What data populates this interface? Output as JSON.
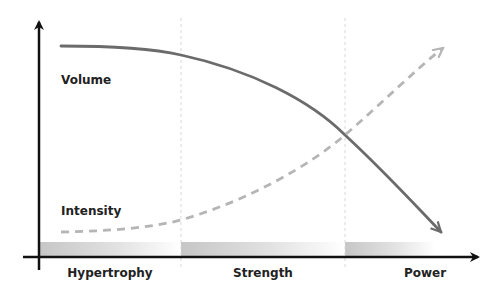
{
  "diagram": {
    "type": "periodization",
    "phases": [
      {
        "label": "Hypertrophy"
      },
      {
        "label": "Strength"
      },
      {
        "label": "Power"
      }
    ],
    "curves": {
      "volume": {
        "label": "Volume",
        "style": "solid",
        "trend": "decreasing",
        "color": "#6b6b6b"
      },
      "intensity": {
        "label": "Intensity",
        "style": "dashed",
        "trend": "increasing",
        "color": "#b5b5b5"
      }
    },
    "colors": {
      "axis": "#111111",
      "divider": "#d8d8d8",
      "phase_bar_start": "#c8c8c8",
      "phase_bar_end": "#ffffff",
      "text": "#222222"
    }
  }
}
